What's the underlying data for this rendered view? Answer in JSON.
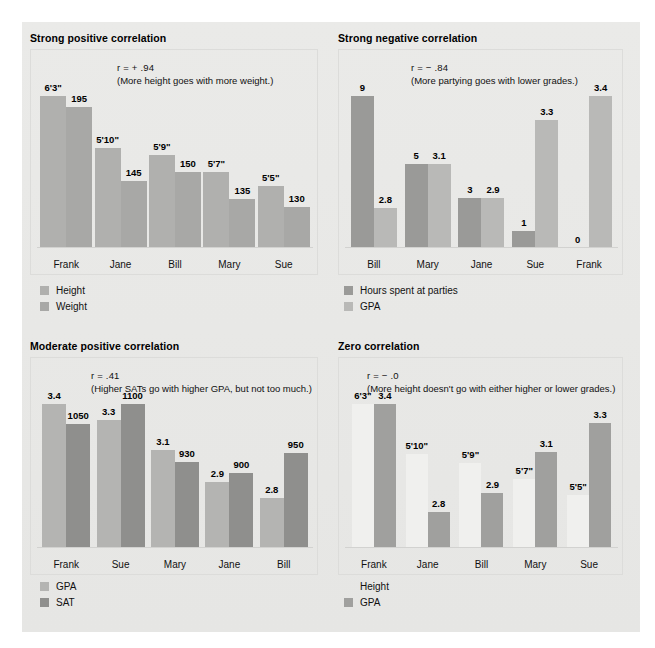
{
  "page": {
    "background": "#e8e8e6",
    "canvas_background": "#ffffff"
  },
  "colors": {
    "bar_light": "#b9b9b7",
    "bar_mid": "#a3a3a1",
    "bar_dark": "#8c8c8a",
    "bar_invisible": "#f0f0ee",
    "text": "#111111",
    "plot_border": "#dcdcda"
  },
  "charts": [
    {
      "id": "strong-positive",
      "title": "Strong positive correlation",
      "r_line": "r = + .94",
      "note": "(More height goes with more weight.)",
      "categories": [
        "Frank",
        "Jane",
        "Bill",
        "Mary",
        "Sue"
      ],
      "series": [
        {
          "name": "Height",
          "color": "#b0b0ae",
          "labels": [
            "6'3\"",
            "5'10\"",
            "5'9\"",
            "5'7\"",
            "5'5\""
          ],
          "values": [
            75,
            70,
            69,
            67,
            65
          ],
          "heights_pct": [
            100,
            66,
            61,
            50,
            41
          ]
        },
        {
          "name": "Weight",
          "color": "#a8a8a6",
          "labels": [
            "195",
            "145",
            "150",
            "135",
            "130"
          ],
          "values": [
            195,
            145,
            150,
            135,
            130
          ],
          "heights_pct": [
            93,
            44,
            50,
            32,
            27
          ]
        }
      ],
      "legend": [
        {
          "label": "Height",
          "color": "#b0b0ae",
          "show_swatch": true
        },
        {
          "label": "Weight",
          "color": "#a8a8a6",
          "show_swatch": true
        }
      ]
    },
    {
      "id": "strong-negative",
      "title": "Strong negative correlation",
      "r_line": "r = − .84",
      "note": "(More partying goes with lower grades.)",
      "categories": [
        "Bill",
        "Mary",
        "Jane",
        "Sue",
        "Frank"
      ],
      "series": [
        {
          "name": "Hours spent at parties",
          "color": "#9a9a98",
          "labels": [
            "9",
            "5",
            "3",
            "1",
            "0"
          ],
          "values": [
            9,
            5,
            3,
            1,
            0
          ],
          "heights_pct": [
            100,
            55,
            33,
            11,
            0
          ]
        },
        {
          "name": "GPA",
          "color": "#b9b9b7",
          "labels": [
            "2.8",
            "3.1",
            "2.9",
            "3.3",
            "3.4"
          ],
          "values": [
            2.8,
            3.1,
            2.9,
            3.3,
            3.4
          ],
          "heights_pct": [
            26,
            55,
            33,
            84,
            100
          ]
        }
      ],
      "legend": [
        {
          "label": "Hours spent at parties",
          "color": "#9a9a98",
          "show_swatch": true
        },
        {
          "label": "GPA",
          "color": "#b9b9b7",
          "show_swatch": true
        }
      ]
    },
    {
      "id": "moderate-positive",
      "title": "Moderate positive correlation",
      "r_line": "r =  .41",
      "note": "(Higher SATs go with higher GPA, but not too much.)",
      "categories": [
        "Frank",
        "Sue",
        "Mary",
        "Jane",
        "Bill"
      ],
      "series": [
        {
          "name": "GPA",
          "color": "#b4b4b2",
          "labels": [
            "3.4",
            "3.3",
            "3.1",
            "2.9",
            "2.8"
          ],
          "values": [
            3.4,
            3.3,
            3.1,
            2.9,
            2.8
          ],
          "heights_pct": [
            100,
            89,
            68,
            46,
            35
          ]
        },
        {
          "name": "SAT",
          "color": "#8f8f8d",
          "labels": [
            "1050",
            "1100",
            "930",
            "900",
            "950"
          ],
          "values": [
            1050,
            1100,
            930,
            900,
            950
          ],
          "heights_pct": [
            86,
            100,
            60,
            52,
            66
          ]
        }
      ],
      "legend": [
        {
          "label": "GPA",
          "color": "#b4b4b2",
          "show_swatch": true
        },
        {
          "label": "SAT",
          "color": "#8f8f8d",
          "show_swatch": true
        }
      ]
    },
    {
      "id": "zero",
      "title": "Zero correlation",
      "r_line": "r = − .0",
      "note": "(More height doesn't go with either higher or lower grades.)",
      "categories": [
        "Frank",
        "Jane",
        "Bill",
        "Mary",
        "Sue"
      ],
      "series": [
        {
          "name": "Height",
          "color": "#f0f0ee",
          "labels": [
            "6'3\"",
            "5'10\"",
            "5'9\"",
            "5'7\"",
            "5'5\""
          ],
          "values": [
            75,
            70,
            69,
            67,
            65
          ],
          "heights_pct": [
            100,
            65,
            59,
            48,
            37
          ]
        },
        {
          "name": "GPA",
          "color": "#a0a09e",
          "labels": [
            "3.4",
            "2.8",
            "2.9",
            "3.1",
            "3.3"
          ],
          "values": [
            3.4,
            2.8,
            2.9,
            3.1,
            3.3
          ],
          "heights_pct": [
            100,
            25,
            38,
            67,
            87
          ]
        }
      ],
      "legend": [
        {
          "label": "Height",
          "color": "#f0f0ee",
          "show_swatch": false
        },
        {
          "label": "GPA",
          "color": "#a0a09e",
          "show_swatch": true
        }
      ]
    }
  ],
  "chart_data": [
    {
      "type": "bar",
      "title": "Strong positive correlation",
      "annotation": "r = + .94  (More height goes with more weight.)",
      "correlation": 0.94,
      "categories": [
        "Frank",
        "Jane",
        "Bill",
        "Mary",
        "Sue"
      ],
      "series": [
        {
          "name": "Height",
          "values": [
            "6'3\"",
            "5'10\"",
            "5'9\"",
            "5'7\"",
            "5'5\""
          ]
        },
        {
          "name": "Weight",
          "values": [
            195,
            145,
            150,
            135,
            130
          ]
        }
      ],
      "xlabel": "",
      "ylabel": "",
      "grid": false,
      "legend_position": "bottom-left"
    },
    {
      "type": "bar",
      "title": "Strong negative correlation",
      "annotation": "r = − .84  (More partying goes with lower grades.)",
      "correlation": -0.84,
      "categories": [
        "Bill",
        "Mary",
        "Jane",
        "Sue",
        "Frank"
      ],
      "series": [
        {
          "name": "Hours spent at parties",
          "values": [
            9,
            5,
            3,
            1,
            0
          ]
        },
        {
          "name": "GPA",
          "values": [
            2.8,
            3.1,
            2.9,
            3.3,
            3.4
          ]
        }
      ],
      "xlabel": "",
      "ylabel": "",
      "grid": false,
      "legend_position": "bottom-left"
    },
    {
      "type": "bar",
      "title": "Moderate positive correlation",
      "annotation": "r = .41  (Higher SATs go with higher GPA, but not too much.)",
      "correlation": 0.41,
      "categories": [
        "Frank",
        "Sue",
        "Mary",
        "Jane",
        "Bill"
      ],
      "series": [
        {
          "name": "GPA",
          "values": [
            3.4,
            3.3,
            3.1,
            2.9,
            2.8
          ]
        },
        {
          "name": "SAT",
          "values": [
            1050,
            1100,
            930,
            900,
            950
          ]
        }
      ],
      "xlabel": "",
      "ylabel": "",
      "grid": false,
      "legend_position": "bottom-left"
    },
    {
      "type": "bar",
      "title": "Zero correlation",
      "annotation": "r = − .0  (More height doesn't go with either higher or lower grades.)",
      "correlation": 0.0,
      "categories": [
        "Frank",
        "Jane",
        "Bill",
        "Mary",
        "Sue"
      ],
      "series": [
        {
          "name": "Height",
          "values": [
            "6'3\"",
            "5'10\"",
            "5'9\"",
            "5'7\"",
            "5'5\""
          ]
        },
        {
          "name": "GPA",
          "values": [
            3.4,
            2.8,
            2.9,
            3.1,
            3.3
          ]
        }
      ],
      "xlabel": "",
      "ylabel": "",
      "grid": false,
      "legend_position": "bottom-left"
    }
  ]
}
